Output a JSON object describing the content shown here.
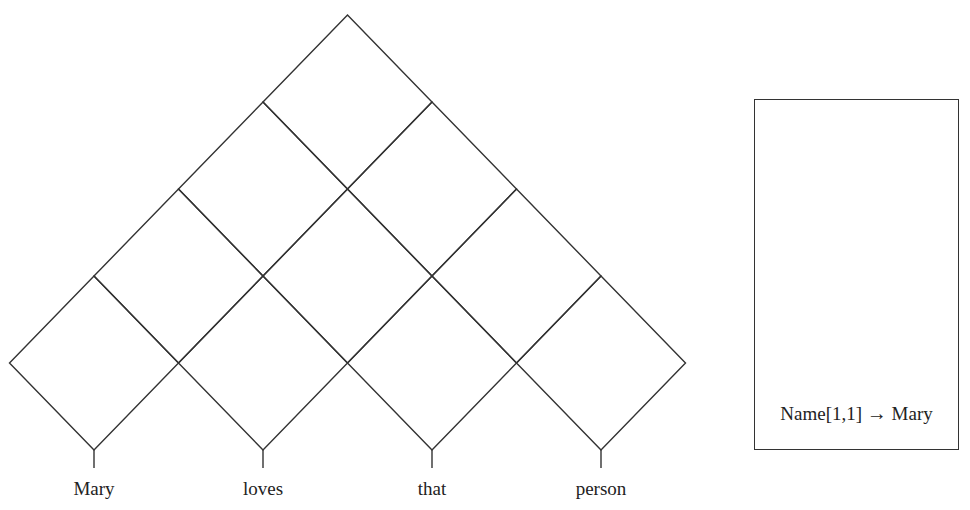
{
  "chart": {
    "words": [
      "Mary",
      "loves",
      "that",
      "person"
    ],
    "rule": {
      "lhs": "Name[1,1]",
      "arrow": "→",
      "rhs": "Mary"
    }
  }
}
